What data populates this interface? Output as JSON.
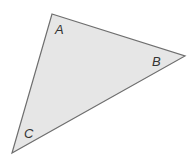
{
  "diagram": {
    "type": "triangle",
    "fill": "#e6e6e6",
    "stroke": "#6e6e6e",
    "vertices": {
      "A": {
        "label": "A",
        "x": 52,
        "y": 14
      },
      "B": {
        "label": "B",
        "x": 185,
        "y": 56
      },
      "C": {
        "label": "C",
        "x": 12,
        "y": 153
      }
    }
  }
}
